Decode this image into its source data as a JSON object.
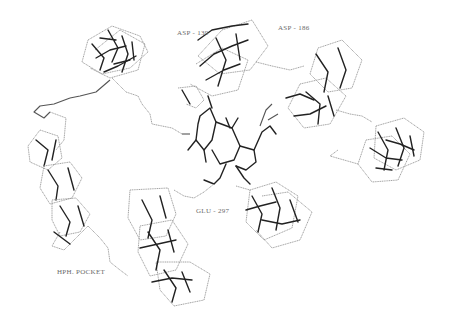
{
  "figure": {
    "background": "#ffffff",
    "colors": {
      "dark_bond": "#222222",
      "light_bond": "#9a9a9a",
      "label": "#6a6a6a"
    }
  },
  "labels": [
    {
      "id": "asp139",
      "text": "ASP - 139",
      "x": 177,
      "y": 29
    },
    {
      "id": "asp186",
      "text": "ASP - 186",
      "x": 278,
      "y": 24
    },
    {
      "id": "glu297",
      "text": "GLU - 297",
      "x": 196,
      "y": 207
    },
    {
      "id": "hph_pocket",
      "text": "HPH. POCKET",
      "x": 57,
      "y": 268
    }
  ]
}
